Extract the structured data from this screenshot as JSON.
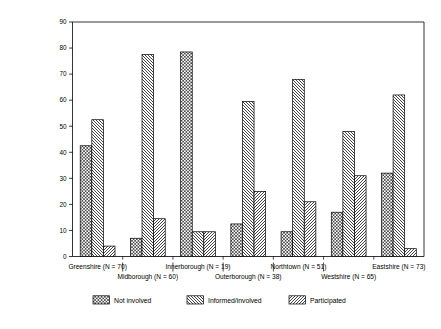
{
  "chart_data": {
    "type": "bar",
    "title": "",
    "xlabel": "",
    "ylabel": "Percentages",
    "ylim": [
      0,
      90
    ],
    "yticks": [
      0,
      10,
      20,
      30,
      40,
      50,
      60,
      70,
      80,
      90
    ],
    "grid": false,
    "legend_position": "bottom",
    "categories": [
      "Greenshire (N = 70)",
      "Midborough (N = 60)",
      "Innerborough (N = 19)",
      "Outerborough (N = 38)",
      "Northtown (N = 51)",
      "Westshire (N = 65)",
      "Eastshire (N = 73)"
    ],
    "series": [
      {
        "name": "Not involved",
        "pattern": "checkered",
        "values": [
          42.5,
          7,
          78.5,
          12.5,
          9.5,
          17,
          32
        ]
      },
      {
        "name": "Informed/involved",
        "pattern": "backslash-hatch",
        "values": [
          52.5,
          77.5,
          9.5,
          59.5,
          68,
          48,
          62
        ]
      },
      {
        "name": "Participated",
        "pattern": "forwardslash-hatch",
        "values": [
          4,
          14.5,
          9.5,
          25,
          21,
          31,
          3
        ]
      }
    ]
  },
  "legend": {
    "items": [
      {
        "label": "Not involved"
      },
      {
        "label": "Informed/involved"
      },
      {
        "label": "Participated"
      }
    ]
  },
  "axis": {
    "y_label": "Percentages",
    "y_ticks": [
      "0",
      "10",
      "20",
      "30",
      "40",
      "50",
      "60",
      "70",
      "80",
      "90"
    ]
  },
  "colors": {
    "background": "#ffffff",
    "foreground": "#000000",
    "bar_fill": "#ffffff",
    "pattern_stroke": "#3a3a3a"
  }
}
